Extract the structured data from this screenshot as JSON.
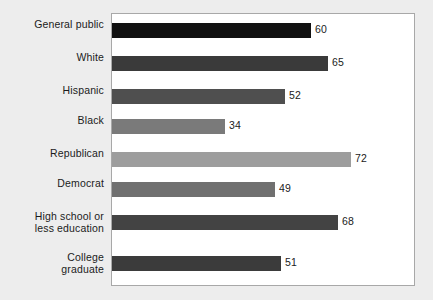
{
  "chart_data": {
    "type": "bar",
    "orientation": "horizontal",
    "title": "",
    "subtitle": "",
    "xlabel": "",
    "ylabel": "",
    "xlim": [
      0,
      91
    ],
    "grid": false,
    "legend": "none",
    "show_value_labels": true,
    "categories": [
      "General public",
      "White",
      "Hispanic",
      "Black",
      "Republican",
      "Democrat",
      "High school or less education",
      "College graduate"
    ],
    "values": [
      60,
      65,
      52,
      34,
      72,
      49,
      68,
      51
    ],
    "bar_colors": [
      "#111111",
      "#3a3a3a",
      "#4f4f4f",
      "#7a7a7a",
      "#9d9d9d",
      "#707070",
      "#434343",
      "#3b3b3b"
    ]
  },
  "figure": {
    "background_color": "#ededed",
    "plot_background_color": "#ffffff",
    "plot_border_color": "#a8a8a8",
    "label_color": "#1b1b1b"
  },
  "rows": [
    {
      "label_line1": "General public",
      "label_line2": "",
      "value": "60",
      "value_number": 60,
      "color": "#111111"
    },
    {
      "label_line1": "White",
      "label_line2": "",
      "value": "65",
      "value_number": 65,
      "color": "#3a3a3a"
    },
    {
      "label_line1": "Hispanic",
      "label_line2": "",
      "value": "52",
      "value_number": 52,
      "color": "#4f4f4f"
    },
    {
      "label_line1": "Black",
      "label_line2": "",
      "value": "34",
      "value_number": 34,
      "color": "#7a7a7a"
    },
    {
      "label_line1": "Republican",
      "label_line2": "",
      "value": "72",
      "value_number": 72,
      "color": "#9d9d9d"
    },
    {
      "label_line1": "Democrat",
      "label_line2": "",
      "value": "49",
      "value_number": 49,
      "color": "#707070"
    },
    {
      "label_line1": "High school or",
      "label_line2": "less education",
      "value": "68",
      "value_number": 68,
      "color": "#434343"
    },
    {
      "label_line1": "College",
      "label_line2": "graduate",
      "value": "51",
      "value_number": 51,
      "color": "#3b3b3b"
    }
  ]
}
